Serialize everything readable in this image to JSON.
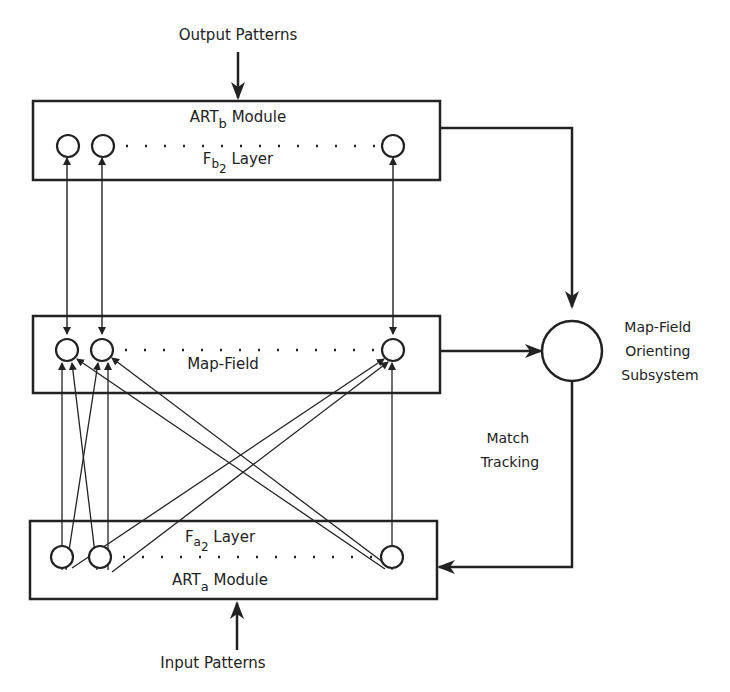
{
  "diagram": {
    "output_label": "Output Patterns",
    "input_label": "Input Patterns",
    "artb": {
      "module_label": "ART",
      "module_sub": "b",
      "module_suffix": " Module",
      "layer_label": "F",
      "layer_sub": "b",
      "layer_subsub": "2",
      "layer_suffix": " Layer"
    },
    "map_field": {
      "label": "Map-Field"
    },
    "arta": {
      "module_label": "ART",
      "module_sub": "a",
      "module_suffix": " Module",
      "layer_label": "F",
      "layer_sub": "a",
      "layer_subsub": "2",
      "layer_suffix": " Layer"
    },
    "orienting": {
      "line1": "Map-Field",
      "line2": "Orienting",
      "line3": "Subsystem"
    },
    "match_tracking": {
      "line1": "Match",
      "line2": "Tracking"
    },
    "colors": {
      "stroke": "#222222",
      "background": "#ffffff"
    }
  }
}
